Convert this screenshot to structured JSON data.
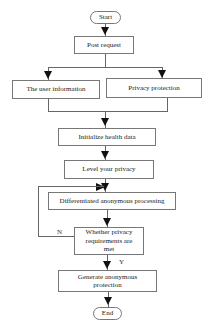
{
  "diagram": {
    "type": "flowchart",
    "nodes": {
      "start": "Start",
      "post_request": "Post request",
      "user_information": "The user information",
      "privacy_protection": "Privacy protection",
      "initialize_health_data": "Initialize health data",
      "level_privacy": "Level your privacy",
      "differentiated_processing": "Differentiated anonymous processing",
      "decision": "Whether privacy requirements are met",
      "generate_protection": "Generate anonymous protection",
      "end": "End"
    },
    "edge_labels": {
      "no": "N",
      "yes": "Y"
    },
    "edges": [
      [
        "start",
        "post_request"
      ],
      [
        "post_request",
        "user_information"
      ],
      [
        "post_request",
        "privacy_protection"
      ],
      [
        "user_information",
        "initialize_health_data"
      ],
      [
        "privacy_protection",
        "initialize_health_data"
      ],
      [
        "initialize_health_data",
        "level_privacy"
      ],
      [
        "level_privacy",
        "differentiated_processing"
      ],
      [
        "differentiated_processing",
        "decision"
      ],
      [
        "decision",
        "differentiated_processing",
        "N"
      ],
      [
        "decision",
        "generate_protection",
        "Y"
      ],
      [
        "generate_protection",
        "end"
      ]
    ]
  }
}
